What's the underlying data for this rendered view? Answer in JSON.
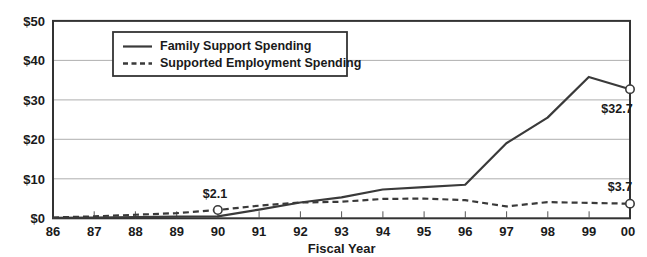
{
  "chart_data": {
    "type": "line",
    "title": "",
    "subtitle": "",
    "xlabel": "Fiscal Year",
    "ylabel": "",
    "categories": [
      "86",
      "87",
      "88",
      "89",
      "90",
      "91",
      "92",
      "93",
      "94",
      "95",
      "96",
      "97",
      "98",
      "99",
      "00"
    ],
    "xlim": [
      "86",
      "00"
    ],
    "ylim": [
      0,
      50
    ],
    "ytick_labels": [
      "$0",
      "$10",
      "$20",
      "$30",
      "$40",
      "$50"
    ],
    "ytick_values": [
      0,
      10,
      20,
      30,
      40,
      50
    ],
    "grid": true,
    "legend_position": "top-center-inside",
    "series": [
      {
        "name": "Family Support Spending",
        "style": "solid",
        "values": [
          0.1,
          0.2,
          0.3,
          0.4,
          0.5,
          2.2,
          4.0,
          5.3,
          7.3,
          7.9,
          8.5,
          19.0,
          25.5,
          35.8,
          32.7
        ]
      },
      {
        "name": "Supported Employment Spending",
        "style": "dashed",
        "values": [
          0.2,
          0.5,
          0.9,
          1.3,
          2.1,
          3.2,
          4.0,
          4.2,
          4.9,
          5.0,
          4.6,
          3.0,
          4.1,
          3.9,
          3.7
        ]
      }
    ],
    "annotations": [
      {
        "text": "$2.1",
        "category": "90",
        "series": "Supported Employment Spending",
        "value": 2.1,
        "marker": true
      },
      {
        "text": "$32.7",
        "category": "00",
        "series": "Family Support Spending",
        "value": 32.7,
        "marker": true
      },
      {
        "text": "$3.7",
        "category": "00",
        "series": "Supported Employment Spending",
        "value": 3.7,
        "marker": true
      }
    ],
    "colors": {
      "line": "#3a3a3a",
      "grid": "#9a9a9a",
      "frame": "#333333",
      "text": "#1a1a1a",
      "background": "#ffffff"
    }
  },
  "legend": {
    "items": [
      {
        "label": "Family Support Spending",
        "style": "solid"
      },
      {
        "label": "Supported Employment Spending",
        "style": "dashed"
      }
    ]
  },
  "axes": {
    "x_title": "Fiscal Year",
    "x_ticks": [
      "86",
      "87",
      "88",
      "89",
      "90",
      "91",
      "92",
      "93",
      "94",
      "95",
      "96",
      "97",
      "98",
      "99",
      "00"
    ],
    "y_ticks": [
      "$50",
      "$40",
      "$30",
      "$20",
      "$10",
      "$0"
    ]
  },
  "annotation_labels": {
    "a1": "$2.1",
    "a2": "$32.7",
    "a3": "$3.7"
  }
}
